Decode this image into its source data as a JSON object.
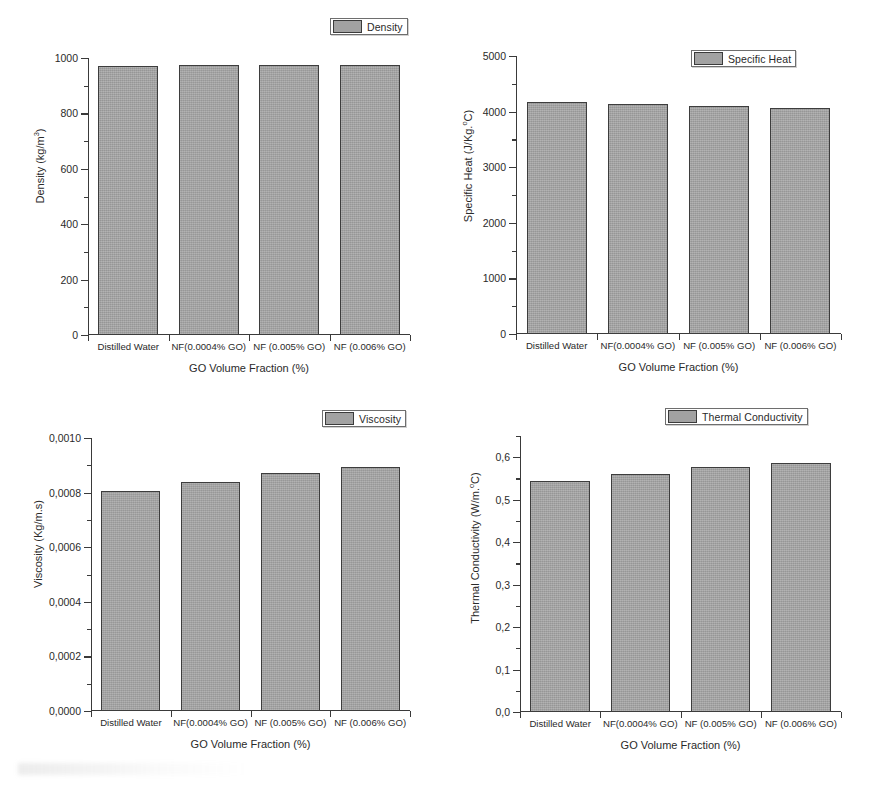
{
  "figure": {
    "background": "#ffffff",
    "bar_fill": "#a3a3a3",
    "bar_edge": "#3d3d3d",
    "axis_color": "#3a3a3a"
  },
  "shared": {
    "categories": [
      "Distilled Water",
      "NF(0.0004% GO)",
      "NF (0.005% GO)",
      "NF (0.006% GO)"
    ],
    "xlabel": "GO Volume Fraction (%)"
  },
  "panels": [
    {
      "id": "density",
      "legend": "Density",
      "ylabel_prefix": "Density (kg/m",
      "ylabel_sup": "3",
      "ylabel_suffix": ")",
      "yticks": [
        "0",
        "200",
        "400",
        "600",
        "800",
        "1000"
      ]
    },
    {
      "id": "specific-heat",
      "legend": "Specific Heat",
      "ylabel_prefix": "Specific Heat (J/Kg.",
      "ylabel_sup": "o",
      "ylabel_suffix": "C)",
      "yticks": [
        "0",
        "1000",
        "2000",
        "3000",
        "4000",
        "5000"
      ]
    },
    {
      "id": "viscosity",
      "legend": "Viscosity",
      "ylabel_prefix": "Viscosity (Kg/m.s)",
      "ylabel_sup": "",
      "ylabel_suffix": "",
      "yticks": [
        "0,0000",
        "0,0002",
        "0,0004",
        "0,0006",
        "0,0008",
        "0,0010"
      ]
    },
    {
      "id": "thermal-conductivity",
      "legend": "Thermal Conductivity",
      "ylabel_prefix": "Thermal Conductivity (W/m.",
      "ylabel_sup": "o",
      "ylabel_suffix": "C)",
      "yticks": [
        "0,0",
        "0,1",
        "0,2",
        "0,3",
        "0,4",
        "0,5",
        "0,6"
      ]
    }
  ],
  "chart_data": [
    {
      "type": "bar",
      "title": "Density",
      "legend": [
        "Density"
      ],
      "legend_position": "top-right",
      "grid": false,
      "categories": [
        "Distilled Water",
        "NF(0.0004% GO)",
        "NF (0.005% GO)",
        "NF (0.006% GO)"
      ],
      "values": [
        972,
        973,
        974,
        975
      ],
      "xlabel": "GO Volume Fraction (%)",
      "ylabel": "Density (kg/m3)",
      "ylim": [
        0,
        1000
      ],
      "ytick_values": [
        0,
        200,
        400,
        600,
        800,
        1000
      ],
      "ytick_labels": [
        "0",
        "200",
        "400",
        "600",
        "800",
        "1000"
      ],
      "minor_ticks": true
    },
    {
      "type": "bar",
      "title": "Specific Heat",
      "legend": [
        "Specific Heat"
      ],
      "legend_position": "top-right",
      "grid": false,
      "categories": [
        "Distilled Water",
        "NF(0.0004% GO)",
        "NF (0.005% GO)",
        "NF (0.006% GO)"
      ],
      "values": [
        4170,
        4140,
        4100,
        4060
      ],
      "xlabel": "GO Volume Fraction (%)",
      "ylabel": "Specific Heat (J/Kg.oC)",
      "ylim": [
        0,
        5000
      ],
      "ytick_values": [
        0,
        1000,
        2000,
        3000,
        4000,
        5000
      ],
      "ytick_labels": [
        "0",
        "1000",
        "2000",
        "3000",
        "4000",
        "5000"
      ],
      "minor_ticks": true
    },
    {
      "type": "bar",
      "title": "Viscosity",
      "legend": [
        "Viscosity"
      ],
      "legend_position": "top-right",
      "grid": false,
      "categories": [
        "Distilled Water",
        "NF(0.0004% GO)",
        "NF (0.005% GO)",
        "NF (0.006% GO)"
      ],
      "values": [
        0.000805,
        0.000838,
        0.000873,
        0.000893
      ],
      "xlabel": "GO Volume Fraction (%)",
      "ylabel": "Viscosity (Kg/m.s)",
      "ylim": [
        0,
        0.001
      ],
      "ytick_values": [
        0,
        0.0002,
        0.0004,
        0.0006,
        0.0008,
        0.001
      ],
      "ytick_labels": [
        "0,0000",
        "0,0002",
        "0,0004",
        "0,0006",
        "0,0008",
        "0,0010"
      ],
      "minor_ticks": true
    },
    {
      "type": "bar",
      "title": "Thermal Conductivity",
      "legend": [
        "Thermal Conductivity"
      ],
      "legend_position": "top-right",
      "grid": false,
      "categories": [
        "Distilled Water",
        "NF(0.0004% GO)",
        "NF (0.005% GO)",
        "NF (0.006% GO)"
      ],
      "values": [
        0.545,
        0.56,
        0.578,
        0.587
      ],
      "xlabel": "GO Volume Fraction (%)",
      "ylabel": "Thermal Conductivity (W/m.oC)",
      "ylim": [
        0,
        0.65
      ],
      "ytick_values": [
        0,
        0.1,
        0.2,
        0.3,
        0.4,
        0.5,
        0.6
      ],
      "ytick_labels": [
        "0,0",
        "0,1",
        "0,2",
        "0,3",
        "0,4",
        "0,5",
        "0,6"
      ],
      "minor_ticks": true
    }
  ]
}
